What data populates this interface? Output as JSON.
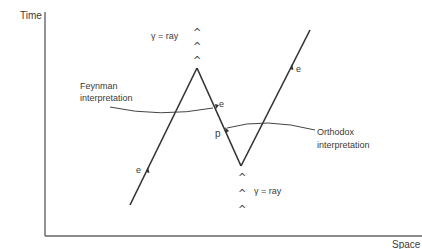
{
  "axes": {
    "y_label": "Time",
    "x_label": "Space"
  },
  "particles": {
    "electron_in": "e",
    "electron_mid": "e",
    "electron_out": "e",
    "positron": "p"
  },
  "photons": {
    "top_label": "γ = ray",
    "bottom_label": "γ = ray",
    "caret_glyph": "^"
  },
  "annotations": {
    "feynman": [
      "Feynman",
      "interpretation"
    ],
    "orthodox": [
      "Orthodox",
      "interpretation"
    ]
  },
  "colors": {
    "ink": "#333333",
    "axis": "#666666"
  }
}
